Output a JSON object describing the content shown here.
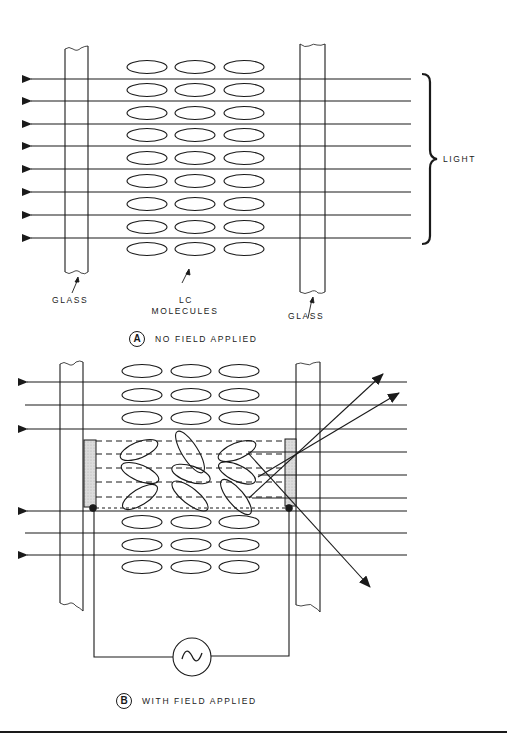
{
  "diagram_a": {
    "badge": "A",
    "caption": "NO FIELD APPLIED",
    "labels": {
      "glass_left": "GLASS",
      "lc_line1": "LC",
      "lc_line2": "MOLECULES",
      "glass_right": "GLASS",
      "light": "LIGHT"
    },
    "light_rays": 8,
    "molecule_rows": 9,
    "molecule_columns": 3
  },
  "diagram_b": {
    "badge": "B",
    "caption": "WITH FIELD APPLIED",
    "ac_source_symbol": "∿",
    "molecule_rows_aligned": 6,
    "molecule_rows_tilted": 3,
    "molecule_columns": 3
  },
  "colors": {
    "ink": "#1a1a1a",
    "electrode_fill": "#d9d9d9",
    "background": "#ffffff"
  }
}
